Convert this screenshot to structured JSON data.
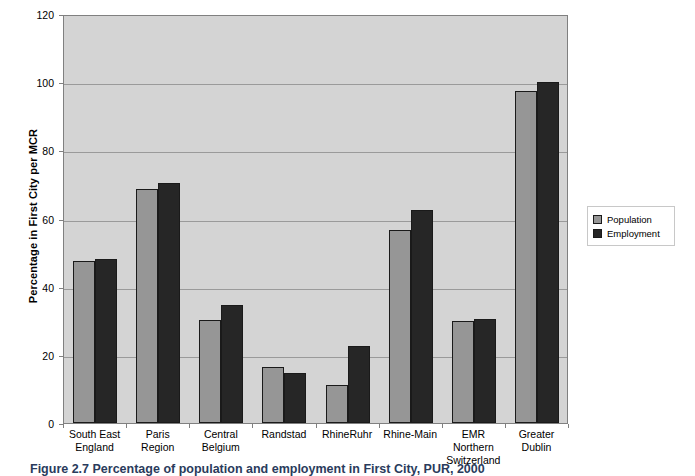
{
  "chart_data": {
    "type": "bar",
    "title": "",
    "xlabel": "",
    "ylabel": "Percentage in First City per MCR",
    "ylim": [
      0,
      120
    ],
    "ytick_step": 20,
    "yticks": [
      0,
      20,
      40,
      60,
      80,
      100,
      120
    ],
    "grid": true,
    "legend_position": "right",
    "categories": [
      "South East England",
      "Paris Region",
      "Central Belgium",
      "Randstad",
      "RhineRuhr",
      "Rhine-Main",
      "EMR Northern Switzerland",
      "Greater Dublin"
    ],
    "category_lines": [
      [
        "South East",
        "England"
      ],
      [
        "Paris",
        "Region"
      ],
      [
        "Central",
        "Belgium"
      ],
      [
        "Randstad",
        ""
      ],
      [
        "RhineRuhr",
        ""
      ],
      [
        "Rhine-Main",
        ""
      ],
      [
        "EMR Northern",
        "Switzerland"
      ],
      [
        "Greater",
        "Dublin"
      ]
    ],
    "series": [
      {
        "name": "Population",
        "color": "#969696",
        "values": [
          47.5,
          68.6,
          30.3,
          16.4,
          11.3,
          56.6,
          30.0,
          97.5
        ]
      },
      {
        "name": "Employment",
        "color": "#262626",
        "values": [
          48.0,
          70.4,
          34.7,
          14.8,
          22.5,
          62.5,
          30.4,
          100.0
        ]
      }
    ]
  },
  "legend": {
    "items": [
      {
        "label": "Population",
        "swatch": "population"
      },
      {
        "label": "Employment",
        "swatch": "employment"
      }
    ]
  },
  "caption": {
    "text": "Figure 2.7 Percentage of population and employment in First City, PUR, 2000"
  },
  "colors": {
    "plot_background": "#d4d4d4",
    "gridline": "#9a9a9a",
    "axis": "#808080",
    "population_bar": "#969696",
    "employment_bar": "#262626",
    "bar_outline": "#1a1a1a"
  }
}
